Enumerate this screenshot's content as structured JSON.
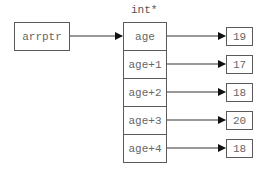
{
  "diagram": {
    "pointer": {
      "label": "arrptr"
    },
    "array_type_label": "int*",
    "cells": [
      {
        "label": "age",
        "value": "19"
      },
      {
        "label": "age+1",
        "value": "17"
      },
      {
        "label": "age+2",
        "value": "18"
      },
      {
        "label": "age+3",
        "value": "20"
      },
      {
        "label": "age+4",
        "value": "18"
      }
    ],
    "colors": {
      "stroke": "#5a5a5a",
      "text": "#666666",
      "background": "#ffffff"
    }
  }
}
